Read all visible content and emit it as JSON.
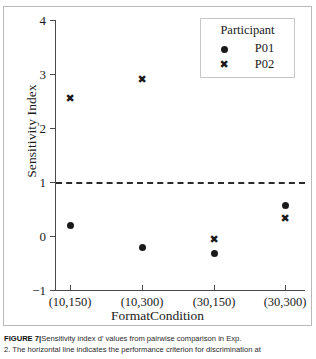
{
  "figure": {
    "caption_label": "FIGURE 7",
    "caption_separator": "|",
    "caption_line1": "Sensitivity index d′ values from pairwise comparison in Exp.",
    "caption_line2": "2. The horizontal line indicates the performance criterion for discrimination at"
  },
  "legend": {
    "title": "Participant",
    "entries": [
      {
        "marker": "dot",
        "marker_glyph": "●",
        "label": "P01"
      },
      {
        "marker": "cross",
        "marker_glyph": "✖",
        "label": "P02"
      }
    ]
  },
  "chart_data": {
    "type": "scatter",
    "title": "",
    "xlabel": "FormatCondition",
    "ylabel": "Sensitivity Index",
    "categories": [
      "(10,150)",
      "(10,300)",
      "(30,150)",
      "(30,300)"
    ],
    "ylim": [
      -1,
      4
    ],
    "yticks": [
      -1,
      0,
      1,
      2,
      3,
      4
    ],
    "ytick_labels": [
      "−1",
      "0",
      "1",
      "2",
      "3",
      "4"
    ],
    "grid": false,
    "legend_position": "top-right",
    "series": [
      {
        "name": "P01",
        "marker": "dot",
        "values": [
          0.19,
          -0.21,
          -0.33,
          0.56
        ]
      },
      {
        "name": "P02",
        "marker": "cross",
        "values": [
          2.55,
          2.89,
          -0.07,
          0.33
        ]
      }
    ],
    "annotations": [
      {
        "type": "hline",
        "name": "performance-criterion-line",
        "y": 1.0,
        "style": "dashed",
        "color": "#2b2b2b"
      }
    ]
  },
  "colors": {
    "marker": "#1a1a1a",
    "axis": "#4a4a4a",
    "frame": "#b9b9b9",
    "criterion": "#2b2b2b"
  }
}
